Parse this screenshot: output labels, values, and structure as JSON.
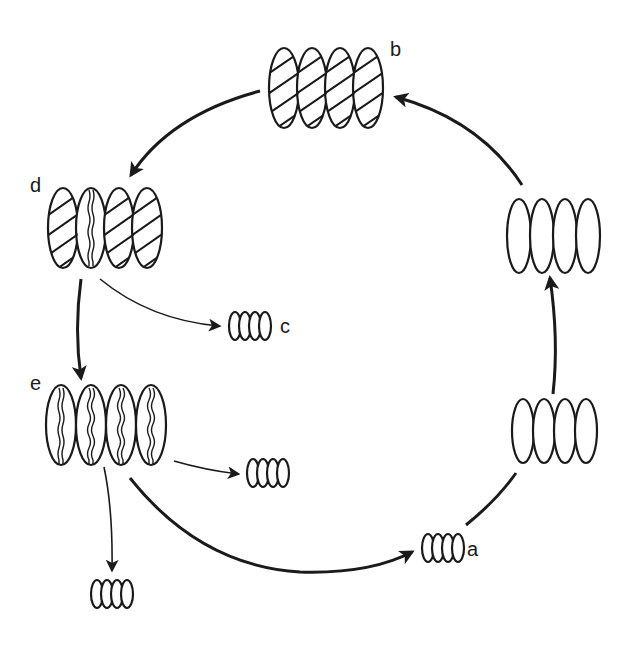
{
  "diagram": {
    "type": "life-cycle",
    "colors": {
      "stroke": "#1a1a1a",
      "background": "#ffffff"
    },
    "nodes": [
      {
        "id": "b",
        "label": "b",
        "cells": 4,
        "fill": "diagonal-hatch",
        "size": "large",
        "position": "top-center"
      },
      {
        "id": "d",
        "label": "d",
        "cells": 4,
        "fill": "hatch, second cell with wavy cleavage line",
        "size": "large",
        "position": "upper-left"
      },
      {
        "id": "c",
        "label": "c",
        "cells": 4,
        "fill": "empty",
        "size": "small",
        "position": "left-middle"
      },
      {
        "id": "e",
        "label": "e",
        "cells": 4,
        "fill": "wavy cleavage line in each cell",
        "size": "large",
        "position": "lower-left"
      },
      {
        "id": "e_offspring_1",
        "label": "",
        "cells": 4,
        "fill": "empty",
        "size": "small",
        "position": "lower-left-center"
      },
      {
        "id": "e_offspring_2",
        "label": "",
        "cells": 4,
        "fill": "empty",
        "size": "small",
        "position": "bottom-left"
      },
      {
        "id": "a",
        "label": "a",
        "cells": 4,
        "fill": "empty",
        "size": "small",
        "position": "bottom-right"
      },
      {
        "id": "growth_1",
        "label": "",
        "cells": 4,
        "fill": "empty",
        "size": "large",
        "position": "right-lower"
      },
      {
        "id": "growth_2",
        "label": "",
        "cells": 4,
        "fill": "empty",
        "size": "large",
        "position": "right-upper"
      }
    ],
    "edges": [
      {
        "from": "b",
        "to": "d",
        "style": "thick"
      },
      {
        "from": "d",
        "to": "c",
        "style": "thin"
      },
      {
        "from": "d",
        "to": "e",
        "style": "thick"
      },
      {
        "from": "e",
        "to": "e_offspring_1",
        "style": "thin"
      },
      {
        "from": "e",
        "to": "e_offspring_2",
        "style": "thin"
      },
      {
        "from": "e",
        "to": "a",
        "style": "thick"
      },
      {
        "from": "a",
        "to": "growth_1",
        "style": "thick"
      },
      {
        "from": "growth_1",
        "to": "growth_2",
        "style": "thick"
      },
      {
        "from": "growth_2",
        "to": "b",
        "style": "thick"
      }
    ]
  },
  "labels": {
    "a": "a",
    "b": "b",
    "c": "c",
    "d": "d",
    "e": "e"
  }
}
